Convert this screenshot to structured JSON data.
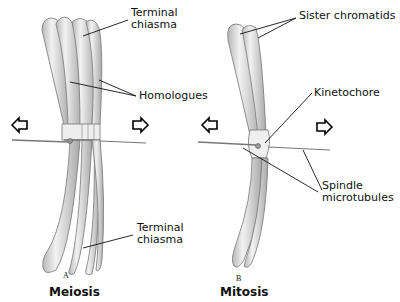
{
  "figure": {
    "panels": [
      {
        "letter": "A",
        "title": "Meiosis",
        "labels": {
          "terminal_chiasma_top": [
            "Terminal",
            "chiasma"
          ],
          "homologues": "Homologues",
          "terminal_chiasma_bottom": [
            "Terminal",
            "chiasma"
          ]
        }
      },
      {
        "letter": "B",
        "title": "Mitosis",
        "labels": {
          "sister_chromatids": "Sister chromatids",
          "kinetochore": "Kinetochore",
          "spindle_microtubules": [
            "Spindle",
            "microtubules"
          ]
        }
      }
    ],
    "icons": [
      "arrow-left-icon",
      "arrow-right-icon"
    ],
    "colors": {
      "chromosome_fill": "#d8d8d8",
      "outline": "#555555",
      "text": "#111111"
    }
  }
}
